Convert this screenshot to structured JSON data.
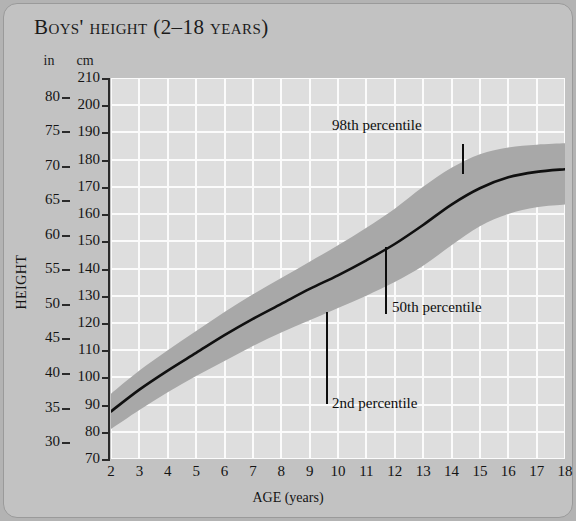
{
  "chart_data": {
    "type": "area",
    "title": "Boys' height (2–18 years)",
    "xlabel": "AGE (years)",
    "ylabel": "HEIGHT",
    "unit_headers": {
      "left": "in",
      "right": "cm"
    },
    "x": [
      2,
      3,
      4,
      5,
      6,
      7,
      8,
      9,
      10,
      11,
      12,
      13,
      14,
      15,
      16,
      17,
      18
    ],
    "xlim": [
      2,
      18
    ],
    "ylim_cm": [
      70,
      210
    ],
    "ylim_in": [
      30,
      80
    ],
    "cm_ticks": [
      70,
      80,
      90,
      100,
      110,
      120,
      130,
      140,
      150,
      160,
      170,
      180,
      190,
      200,
      210
    ],
    "in_ticks": [
      30,
      35,
      40,
      45,
      50,
      55,
      60,
      65,
      70,
      75,
      80
    ],
    "grid": true,
    "legend": "none",
    "series": [
      {
        "name": "2nd percentile",
        "unit": "cm",
        "values": [
          81.0,
          88.0,
          94.5,
          100.5,
          106.0,
          111.5,
          116.5,
          121.0,
          125.5,
          130.0,
          135.0,
          141.0,
          148.5,
          155.5,
          160.0,
          162.5,
          163.5
        ]
      },
      {
        "name": "50th percentile",
        "unit": "cm",
        "values": [
          87.5,
          95.5,
          102.5,
          109.0,
          115.5,
          121.5,
          127.0,
          132.5,
          137.5,
          143.0,
          149.0,
          156.0,
          163.5,
          169.5,
          173.5,
          175.5,
          176.5
        ]
      },
      {
        "name": "98th percentile",
        "unit": "cm",
        "values": [
          94.0,
          102.5,
          110.0,
          117.0,
          124.0,
          130.5,
          136.5,
          142.5,
          148.5,
          155.0,
          162.0,
          170.0,
          177.0,
          182.0,
          184.5,
          185.5,
          186.0
        ]
      }
    ],
    "annotations": [
      {
        "text": "98th percentile",
        "target_age": 14.0
      },
      {
        "text": "50th percentile",
        "target_age": 11.9
      },
      {
        "text": "2nd percentile",
        "target_age": 9.6
      }
    ],
    "colors": {
      "band": "#a8a8a8",
      "plot_background": "#dedede",
      "gridline": "#fbfbfb",
      "median_line": "#101010",
      "card_background": "#c2c2c2"
    }
  }
}
